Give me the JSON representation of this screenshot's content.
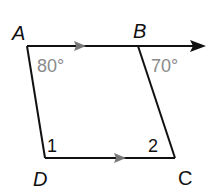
{
  "diagram": {
    "type": "quadrilateral",
    "vertices": {
      "A": {
        "label": "A"
      },
      "B": {
        "label": "B"
      },
      "C": {
        "label": "C"
      },
      "D": {
        "label": "D"
      }
    },
    "angles": {
      "A": "80°",
      "B": "70°",
      "D": "1",
      "C": "2"
    },
    "notes": {
      "parallel_marks": "AB ∥ DC (arrow marks)",
      "ray": "AB extends beyond B as a ray"
    },
    "colors": {
      "line": "#111111",
      "angle_text": "#8a8a8a",
      "arrow_mark": "#777777"
    }
  }
}
